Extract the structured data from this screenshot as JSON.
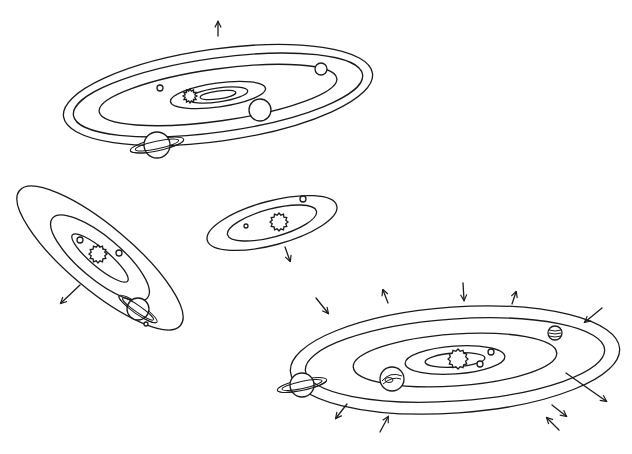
{
  "diagram": {
    "title": "",
    "stroke_color": "#1a1a1a",
    "background": "#ffffff",
    "systems": [
      {
        "id": "top-system",
        "center": [
          218,
          95
        ],
        "rotation_deg": -8,
        "orbits": [
          {
            "rx": 156,
            "ry": 46
          },
          {
            "rx": 146,
            "ry": 37
          },
          {
            "rx": 120,
            "ry": 26
          },
          {
            "rx": 48,
            "ry": 12
          },
          {
            "rx": 30,
            "ry": 7
          },
          {
            "rx": 18,
            "ry": 4
          }
        ],
        "sun": {
          "cx": 190,
          "cy": 96,
          "r": 5
        },
        "planets": [
          {
            "type": "small",
            "cx": 321,
            "cy": 69,
            "r": 6
          },
          {
            "type": "medium",
            "cx": 260,
            "cy": 110,
            "r": 11
          },
          {
            "type": "tiny",
            "cx": 160,
            "cy": 88,
            "r": 3
          },
          {
            "type": "ringed",
            "cx": 157,
            "cy": 145,
            "r": 13
          }
        ],
        "arrows": [
          {
            "x1": 218,
            "y1": 36,
            "x2": 218,
            "y2": 22
          }
        ]
      },
      {
        "id": "left-system",
        "center": [
          100,
          258
        ],
        "rotation_deg": 40,
        "orbits": [
          {
            "rx": 105,
            "ry": 32
          },
          {
            "rx": 62,
            "ry": 21
          },
          {
            "rx": 36,
            "ry": 9
          }
        ],
        "sun": {
          "cx": 98,
          "cy": 254,
          "r": 7
        },
        "planets": [
          {
            "type": "tiny",
            "cx": 80,
            "cy": 240,
            "r": 3
          },
          {
            "type": "tiny",
            "cx": 119,
            "cy": 253,
            "r": 3
          },
          {
            "type": "ringed-tilted",
            "cx": 138,
            "cy": 309,
            "r": 11
          },
          {
            "type": "moon",
            "cx": 146,
            "cy": 324,
            "r": 2
          }
        ],
        "arrows": [
          {
            "x1": 80,
            "y1": 285,
            "x2": 61,
            "y2": 303
          }
        ]
      },
      {
        "id": "middle-system",
        "center": [
          272,
          223
        ],
        "rotation_deg": -15,
        "orbits": [
          {
            "rx": 67,
            "ry": 22
          },
          {
            "rx": 46,
            "ry": 14
          }
        ],
        "sun": {
          "cx": 279,
          "cy": 222,
          "r": 7
        },
        "planets": [
          {
            "type": "tiny",
            "cx": 303,
            "cy": 199,
            "r": 3
          },
          {
            "type": "tiny",
            "cx": 246,
            "cy": 226,
            "r": 2
          }
        ],
        "arrows": [
          {
            "x1": 285,
            "y1": 247,
            "x2": 290,
            "y2": 261
          }
        ]
      },
      {
        "id": "bottom-system",
        "center": [
          455,
          360
        ],
        "rotation_deg": -4,
        "orbits": [
          {
            "rx": 165,
            "ry": 53
          },
          {
            "rx": 150,
            "ry": 41
          },
          {
            "rx": 102,
            "ry": 26
          },
          {
            "rx": 50,
            "ry": 14
          },
          {
            "rx": 30,
            "ry": 7
          }
        ],
        "sun": {
          "cx": 458,
          "cy": 359,
          "r": 8
        },
        "planets": [
          {
            "type": "tiny",
            "cx": 491,
            "cy": 352,
            "r": 3
          },
          {
            "type": "tiny",
            "cx": 480,
            "cy": 364,
            "r": 3
          },
          {
            "type": "banded",
            "cx": 555,
            "cy": 333,
            "r": 7
          },
          {
            "type": "storm",
            "cx": 392,
            "cy": 379,
            "r": 12
          },
          {
            "type": "ringed",
            "cx": 302,
            "cy": 385,
            "r": 12
          }
        ],
        "arrows": [
          {
            "x1": 316,
            "y1": 298,
            "x2": 328,
            "y2": 313
          },
          {
            "x1": 388,
            "y1": 303,
            "x2": 383,
            "y2": 290
          },
          {
            "x1": 463,
            "y1": 283,
            "x2": 464,
            "y2": 300
          },
          {
            "x1": 512,
            "y1": 304,
            "x2": 516,
            "y2": 292
          },
          {
            "x1": 602,
            "y1": 308,
            "x2": 585,
            "y2": 322
          },
          {
            "x1": 566,
            "y1": 373,
            "x2": 606,
            "y2": 401
          },
          {
            "x1": 552,
            "y1": 405,
            "x2": 566,
            "y2": 416
          },
          {
            "x1": 559,
            "y1": 430,
            "x2": 547,
            "y2": 418
          },
          {
            "x1": 347,
            "y1": 404,
            "x2": 336,
            "y2": 418
          },
          {
            "x1": 380,
            "y1": 432,
            "x2": 388,
            "y2": 417
          }
        ]
      }
    ]
  }
}
